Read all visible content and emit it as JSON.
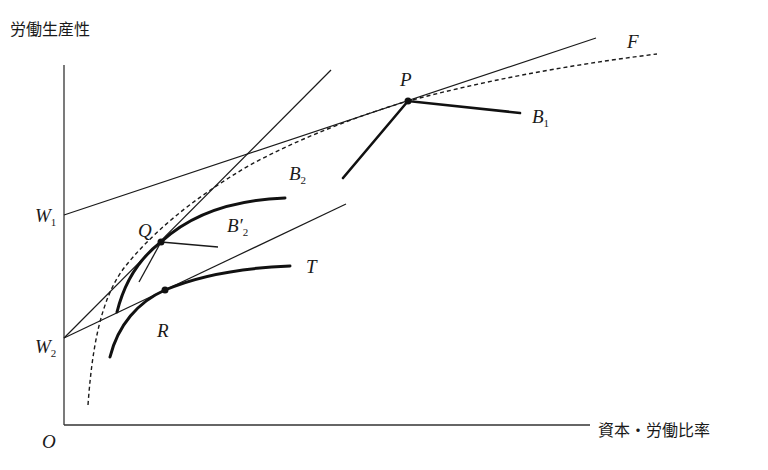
{
  "axes": {
    "y_label": "労働生産性",
    "x_label": "資本・労働比率",
    "origin_label": "O"
  },
  "intercepts": {
    "w1": {
      "main": "W",
      "sub": "1"
    },
    "w2": {
      "main": "W",
      "sub": "2"
    }
  },
  "points": {
    "p": "P",
    "q": "Q",
    "r": "R"
  },
  "curves": {
    "f": {
      "main": "F",
      "sub": ""
    },
    "b1": {
      "main": "B",
      "sub": "1"
    },
    "b2": {
      "main": "B",
      "sub": "2"
    },
    "b2_prime": {
      "main": "B′",
      "sub": "2"
    },
    "t": {
      "main": "T",
      "sub": ""
    }
  },
  "colors": {
    "ink": "#1a1a1a",
    "background": "#ffffff"
  }
}
